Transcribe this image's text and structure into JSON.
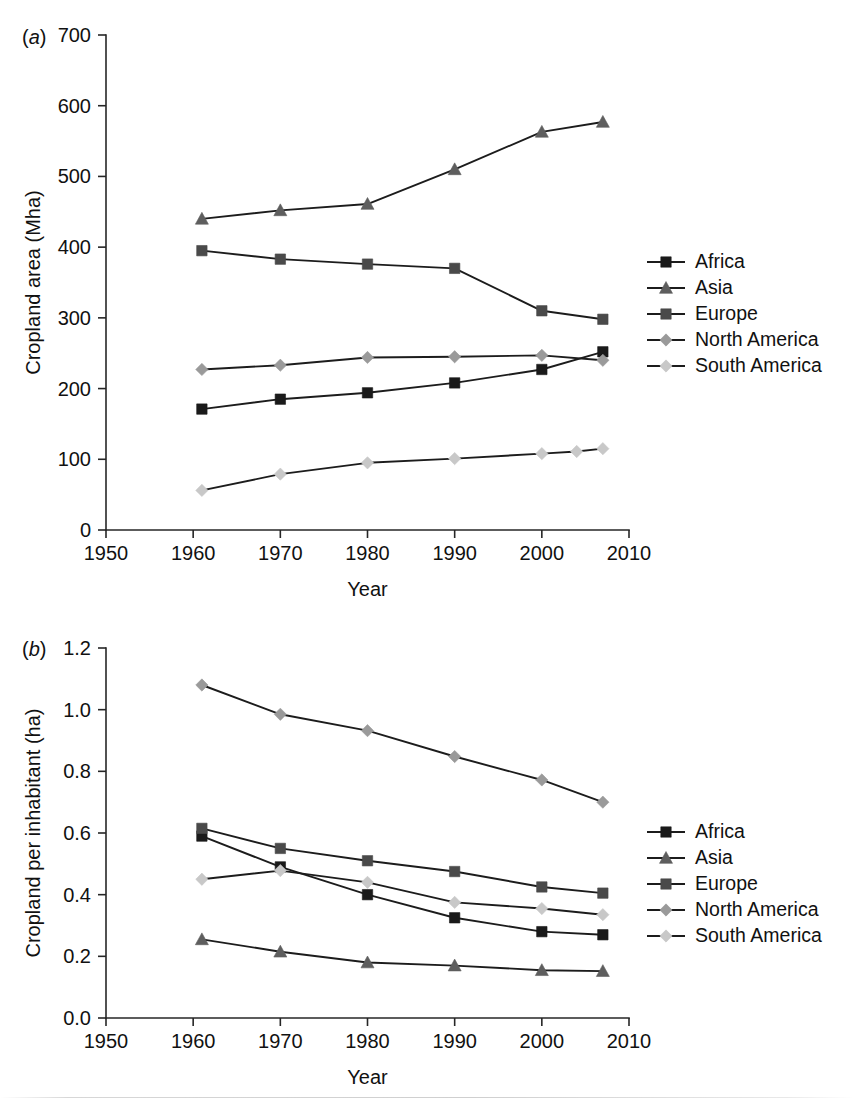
{
  "figure": {
    "background": "#ffffff",
    "panels": [
      {
        "id": "a",
        "label": "(a)",
        "label_letter": "a"
      },
      {
        "id": "b",
        "label": "(b)",
        "label_letter": "b"
      }
    ]
  },
  "colors": {
    "africa": "#1a1a1a",
    "asia": "#5e5e5e",
    "europe": "#4a4a4a",
    "north_america": "#9a9a9a",
    "south_america": "#c8c8c8",
    "line": "#1c1c1c",
    "axis": "#262626",
    "text": "#111111"
  },
  "chart_data": [
    {
      "id": "panel-a",
      "type": "line",
      "panel_label": "(a)",
      "title": "",
      "xlabel": "Year",
      "ylabel": "Cropland area (Mha)",
      "xlim": [
        1950,
        2010
      ],
      "ylim": [
        0,
        700
      ],
      "xticks": [
        1950,
        1960,
        1970,
        1980,
        1990,
        2000,
        2010
      ],
      "yticks": [
        0,
        100,
        200,
        300,
        400,
        500,
        600,
        700
      ],
      "xticklabels": [
        "1950",
        "1960",
        "1970",
        "1980",
        "1990",
        "2000",
        "2010"
      ],
      "yticklabels": [
        "0",
        "100",
        "200",
        "300",
        "400",
        "500",
        "600",
        "700"
      ],
      "grid": false,
      "legend_position": "right",
      "series": [
        {
          "name": "Africa",
          "marker": "square",
          "color": "#1a1a1a",
          "x": [
            1961,
            1970,
            1980,
            1990,
            2000,
            2007
          ],
          "values": [
            171,
            185,
            194,
            208,
            227,
            252
          ]
        },
        {
          "name": "Asia",
          "marker": "triangle",
          "color": "#5e5e5e",
          "x": [
            1961,
            1970,
            1980,
            1990,
            2000,
            2007
          ],
          "values": [
            440,
            452,
            461,
            510,
            563,
            577
          ]
        },
        {
          "name": "Europe",
          "marker": "square",
          "color": "#4a4a4a",
          "x": [
            1961,
            1970,
            1980,
            1990,
            2000,
            2007
          ],
          "values": [
            395,
            383,
            376,
            370,
            310,
            298
          ]
        },
        {
          "name": "North America",
          "marker": "diamond",
          "color": "#9a9a9a",
          "x": [
            1961,
            1970,
            1980,
            1990,
            2000,
            2007
          ],
          "values": [
            227,
            233,
            244,
            245,
            247,
            240
          ]
        },
        {
          "name": "South America",
          "marker": "diamond",
          "color": "#c8c8c8",
          "x": [
            1961,
            1970,
            1980,
            1990,
            2000,
            2004,
            2007
          ],
          "values": [
            56,
            79,
            95,
            101,
            108,
            111,
            115
          ]
        }
      ]
    },
    {
      "id": "panel-b",
      "type": "line",
      "panel_label": "(b)",
      "title": "",
      "xlabel": "Year",
      "ylabel": "Cropland per inhabitant (ha)",
      "xlim": [
        1950,
        2010
      ],
      "ylim": [
        0.0,
        1.2
      ],
      "xticks": [
        1950,
        1960,
        1970,
        1980,
        1990,
        2000,
        2010
      ],
      "yticks": [
        0.0,
        0.2,
        0.4,
        0.6,
        0.8,
        1.0,
        1.2
      ],
      "xticklabels": [
        "1950",
        "1960",
        "1970",
        "1980",
        "1990",
        "2000",
        "2010"
      ],
      "yticklabels": [
        "0.0",
        "0.2",
        "0.4",
        "0.6",
        "0.8",
        "1.0",
        "1.2"
      ],
      "grid": false,
      "legend_position": "right",
      "series": [
        {
          "name": "Africa",
          "marker": "square",
          "color": "#1a1a1a",
          "x": [
            1961,
            1970,
            1980,
            1990,
            2000,
            2007
          ],
          "values": [
            0.59,
            0.49,
            0.4,
            0.325,
            0.28,
            0.27
          ]
        },
        {
          "name": "Asia",
          "marker": "triangle",
          "color": "#5e5e5e",
          "x": [
            1961,
            1970,
            1980,
            1990,
            2000,
            2007
          ],
          "values": [
            0.255,
            0.215,
            0.18,
            0.17,
            0.155,
            0.152
          ]
        },
        {
          "name": "Europe",
          "marker": "square",
          "color": "#4a4a4a",
          "x": [
            1961,
            1970,
            1980,
            1990,
            2000,
            2007
          ],
          "values": [
            0.615,
            0.55,
            0.51,
            0.475,
            0.425,
            0.405
          ]
        },
        {
          "name": "North America",
          "marker": "diamond",
          "color": "#9a9a9a",
          "x": [
            1961,
            1970,
            1980,
            1990,
            2000,
            2007
          ],
          "values": [
            1.08,
            0.985,
            0.932,
            0.848,
            0.772,
            0.7
          ]
        },
        {
          "name": "South America",
          "marker": "diamond",
          "color": "#c8c8c8",
          "x": [
            1961,
            1970,
            1980,
            1990,
            2000,
            2007
          ],
          "values": [
            0.45,
            0.478,
            0.44,
            0.375,
            0.355,
            0.335
          ]
        }
      ]
    }
  ],
  "legend": {
    "items": [
      {
        "label": "Africa",
        "marker": "square",
        "color": "#1a1a1a"
      },
      {
        "label": "Asia",
        "marker": "triangle",
        "color": "#5e5e5e"
      },
      {
        "label": "Europe",
        "marker": "square",
        "color": "#4a4a4a"
      },
      {
        "label": "North America",
        "marker": "diamond",
        "color": "#9a9a9a"
      },
      {
        "label": "South America",
        "marker": "diamond",
        "color": "#c8c8c8"
      }
    ]
  }
}
